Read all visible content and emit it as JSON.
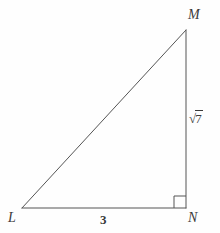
{
  "figure": {
    "kind": "right-triangle",
    "background_color": "#fefefe",
    "stroke_color": "#555555",
    "text_color": "#3a3a3a",
    "stroke_width": 1
  },
  "vertices": [
    {
      "name": "M",
      "label": "M",
      "x": 186,
      "y": 30
    },
    {
      "name": "L",
      "label": "L",
      "x": 22,
      "y": 208
    },
    {
      "name": "N",
      "label": "N",
      "x": 186,
      "y": 208
    }
  ],
  "sides": [
    {
      "name": "LM",
      "role": "hypotenuse",
      "label": ""
    },
    {
      "name": "LN",
      "role": "base-leg",
      "label": "3"
    },
    {
      "name": "MN",
      "role": "vertical-leg",
      "label_radical_sign": "√",
      "label_radicand": "7"
    }
  ],
  "angle_marks": [
    {
      "at_vertex": "N",
      "type": "right-angle-square",
      "size": 12
    }
  ],
  "geometry": {
    "leg_base_length": "3",
    "leg_vertical_length": "√7"
  }
}
